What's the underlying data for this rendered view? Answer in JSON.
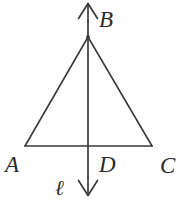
{
  "figure": {
    "background_color": "#ffffff",
    "stroke_color": "#3a3a3a",
    "label_color": "#2b2b2b",
    "labels": {
      "apex": "B",
      "base_left": "A",
      "base_midpoint": "D",
      "base_right": "C",
      "line": "ℓ"
    },
    "points": {
      "B": {
        "x": 88,
        "y": 37
      },
      "A": {
        "x": 25,
        "y": 146
      },
      "D": {
        "x": 88,
        "y": 146
      },
      "C": {
        "x": 152,
        "y": 146
      }
    },
    "line_l": {
      "x": 88,
      "top_arrow_tip_y": 3,
      "bottom_arrow_tip_y": 196,
      "arrowheads": "both"
    },
    "segments": [
      {
        "name": "AB",
        "from": "A",
        "to": "B"
      },
      {
        "name": "BC",
        "from": "B",
        "to": "C"
      },
      {
        "name": "AC",
        "from": "A",
        "to": "C"
      }
    ]
  }
}
